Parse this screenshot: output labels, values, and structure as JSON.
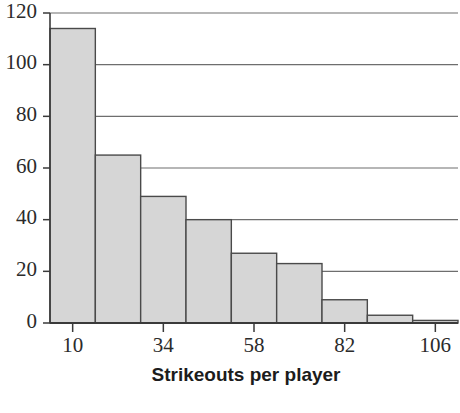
{
  "chart_data": {
    "type": "bar",
    "title": "",
    "subtitle": "",
    "xlabel": "Strikeouts per player",
    "ylabel": "",
    "categories": [
      "10",
      "22",
      "34",
      "46",
      "58",
      "70",
      "82",
      "94",
      "106"
    ],
    "values": [
      114,
      65,
      49,
      40,
      27,
      23,
      9,
      3,
      1
    ],
    "bin_width": 12,
    "bin_centers": [
      10,
      22,
      34,
      46,
      58,
      70,
      82,
      94,
      106
    ],
    "bin_edges": [
      4,
      16,
      28,
      40,
      52,
      64,
      76,
      88,
      100,
      112
    ],
    "xlim": [
      4,
      112
    ],
    "ylim": [
      0,
      120
    ],
    "x_tick_labels": [
      "10",
      "34",
      "58",
      "82",
      "106"
    ],
    "x_tick_values": [
      10,
      34,
      58,
      82,
      106
    ],
    "y_tick_labels": [
      "0",
      "20",
      "40",
      "60",
      "80",
      "100",
      "120"
    ],
    "y_tick_values": [
      0,
      20,
      40,
      60,
      80,
      100,
      120
    ],
    "grid": "horizontal",
    "legend": "none",
    "bar_fill_color": "#d6d6d6",
    "bar_edge_color": "#4a4a4a",
    "axis_color": "#3a3a3a",
    "grid_color": "#6e6e6e",
    "text_color": "#2b2b2b"
  }
}
